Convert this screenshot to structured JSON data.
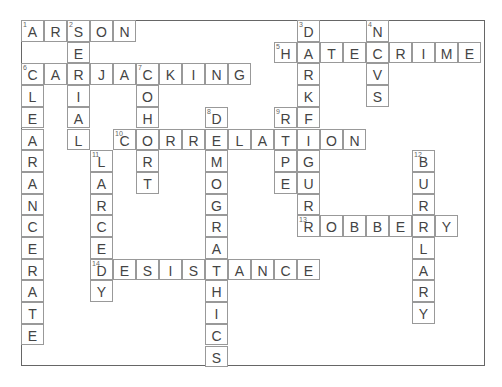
{
  "puzzle": {
    "title": "Crossword",
    "grid": {
      "cols": 20,
      "rows": 16,
      "cell_w": 23,
      "cell_h": 21.7
    },
    "words": [
      {
        "num": 1,
        "dir": "across",
        "row": 0,
        "col": 0,
        "answer": "ARSON"
      },
      {
        "num": 2,
        "dir": "down",
        "row": 0,
        "col": 2,
        "answer": "SERIAL"
      },
      {
        "num": 3,
        "dir": "down",
        "row": 0,
        "col": 12,
        "answer": "DARKFIGURE"
      },
      {
        "num": 4,
        "dir": "down",
        "row": 0,
        "col": 15,
        "answer": "NCVS"
      },
      {
        "num": 5,
        "dir": "across",
        "row": 1,
        "col": 11,
        "answer": "HATECRIME"
      },
      {
        "num": 6,
        "dir": "across",
        "row": 2,
        "col": 0,
        "answer": "CARJACKING"
      },
      {
        "num": 6,
        "dir": "down",
        "row": 2,
        "col": 0,
        "answer": "CLEARANCERATE"
      },
      {
        "num": 7,
        "dir": "down",
        "row": 2,
        "col": 5,
        "answer": "COHORT"
      },
      {
        "num": 8,
        "dir": "down",
        "row": 4,
        "col": 8,
        "answer": "DEMOGRAPHICS"
      },
      {
        "num": 9,
        "dir": "down",
        "row": 4,
        "col": 11,
        "answer": "RAPE"
      },
      {
        "num": 10,
        "dir": "across",
        "row": 5,
        "col": 4,
        "answer": "CORRELATION"
      },
      {
        "num": 11,
        "dir": "down",
        "row": 6,
        "col": 3,
        "answer": "LARCENY"
      },
      {
        "num": 12,
        "dir": "down",
        "row": 6,
        "col": 17,
        "answer": "BURGLARY"
      },
      {
        "num": 13,
        "dir": "across",
        "row": 9,
        "col": 12,
        "answer": "ROBBERY"
      },
      {
        "num": 14,
        "dir": "across",
        "row": 11,
        "col": 3,
        "answer": "DESISTANCE"
      }
    ]
  }
}
